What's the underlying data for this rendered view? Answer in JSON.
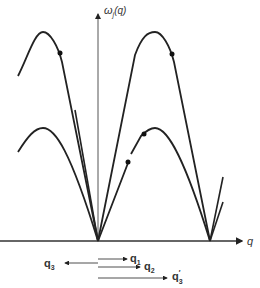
{
  "diagram": {
    "y_axis_label": "ω",
    "y_axis_sub": "j",
    "y_axis_arg": "(q)",
    "x_axis_label": "q",
    "vectors": [
      {
        "name": "q",
        "sub": "1",
        "prime": ""
      },
      {
        "name": "q",
        "sub": "2",
        "prime": ""
      },
      {
        "name": "q",
        "sub": "3",
        "prime": ""
      },
      {
        "name": "q",
        "sub": "3",
        "prime": "′"
      }
    ]
  }
}
